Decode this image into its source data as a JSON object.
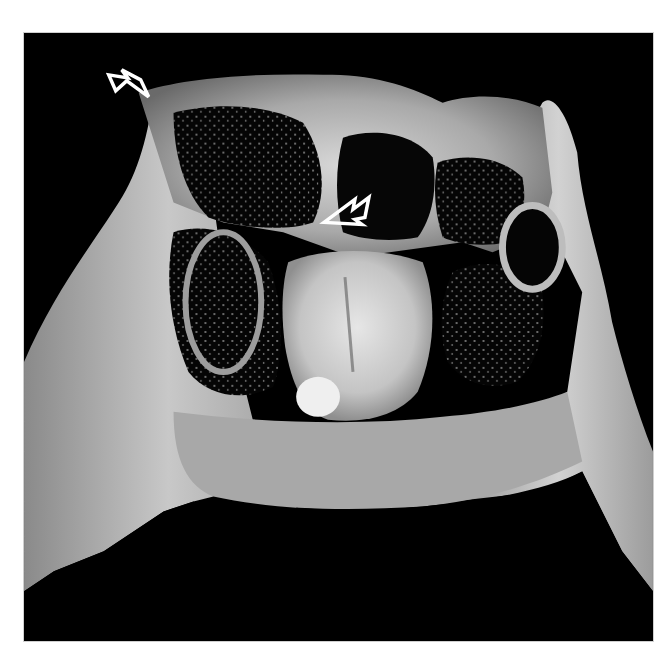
{
  "figure": {
    "type": "grayscale specimen photograph",
    "background_color": "#000000",
    "border_color": "#cfcfcf",
    "frame": {
      "x": 23,
      "y": 32,
      "width": 631,
      "height": 610
    },
    "annotations": [
      {
        "kind": "arrow",
        "color": "#ffffff",
        "style": "open outline",
        "tip": [
          148,
          96
        ],
        "direction": "down-right"
      },
      {
        "kind": "arrow",
        "color": "#ffffff",
        "style": "open outline",
        "tip": [
          323,
          222
        ],
        "direction": "down-left"
      }
    ]
  }
}
